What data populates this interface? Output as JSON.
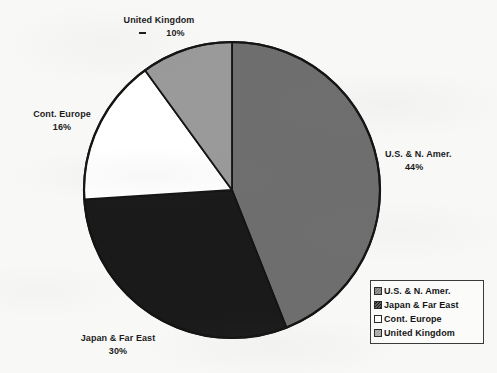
{
  "chart_data": {
    "type": "pie",
    "title": "",
    "subtitle": "",
    "xlabel": "",
    "ylabel": "",
    "legend_position": "bottom-right",
    "grid": false,
    "categories": [
      "U.S. & N. Amer.",
      "Japan & Far East",
      "Cont. Europe",
      "United Kingdom"
    ],
    "values": [
      44,
      30,
      16,
      10
    ],
    "value_unit": "%",
    "start_angle_deg": 0,
    "direction": "clockwise",
    "slice_colors": [
      "#6e6e6e",
      "#1a1a1a",
      "#ffffff",
      "#9a9a9a"
    ],
    "slices": [
      {
        "label": "U.S. & N. Amer.",
        "value": 44,
        "display": "44%",
        "color": "#6e6e6e"
      },
      {
        "label": "Japan & Far East",
        "value": 30,
        "display": "30%",
        "color": "#1a1a1a"
      },
      {
        "label": "Cont. Europe",
        "value": 16,
        "display": "16%",
        "color": "#ffffff"
      },
      {
        "label": "United Kingdom",
        "value": 10,
        "display": "10%",
        "color": "#9a9a9a"
      }
    ],
    "annotations": []
  },
  "labels": {
    "usa": {
      "name": "U.S. & N. Amer.",
      "pct": "44%"
    },
    "japan": {
      "name": "Japan & Far East",
      "pct": "30%"
    },
    "europe": {
      "name": "Cont. Europe",
      "pct": "16%"
    },
    "uk": {
      "name": "United Kingdom",
      "pct": "10%"
    }
  },
  "legend": {
    "items": [
      {
        "label": "U.S. & N. Amer.",
        "color": "#6e6e6e"
      },
      {
        "label": "Japan & Far East",
        "color": "#1a1a1a"
      },
      {
        "label": "Cont. Europe",
        "color": "#ffffff"
      },
      {
        "label": "United Kingdom",
        "color": "#9a9a9a"
      }
    ]
  },
  "style": {
    "background": "#f8f8f7",
    "outline": "#141414",
    "text": "#1b1b1b"
  }
}
